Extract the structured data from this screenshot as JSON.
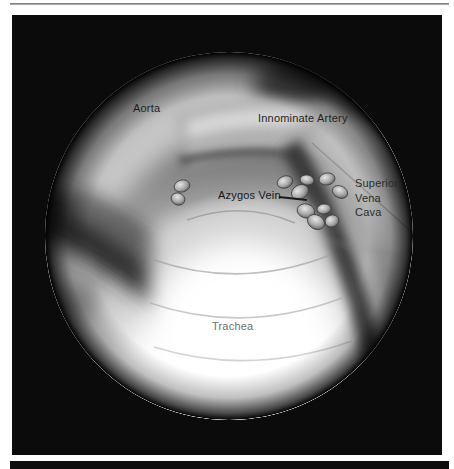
{
  "figure": {
    "labels": {
      "aorta": "Aorta",
      "innominate_artery": "Innominate Artery",
      "azygos_vein": "Azygos Vein",
      "svc": {
        "line1": "Superior",
        "line2": "Vena",
        "line3": "Cava"
      },
      "trachea": "Trachea"
    },
    "colors": {
      "page_background": "#ffffff",
      "panel_background": "#0b0b0b",
      "rule_gray": "#6e6e6e",
      "label_dark": "#1f1f1f",
      "label_gray": "#707070"
    }
  }
}
